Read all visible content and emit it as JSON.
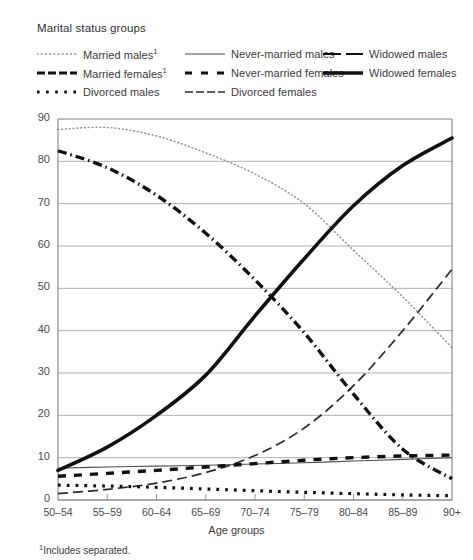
{
  "legend": {
    "title": "Marital status groups",
    "columns": [
      {
        "items": [
          {
            "label": "Married males",
            "footnote_mark": "1",
            "style": "fine-dotted",
            "name": "married-males"
          },
          {
            "label": "Married females",
            "footnote_mark": "1",
            "style": "dash-dot-thick",
            "name": "married-females"
          },
          {
            "label": "Divorced males",
            "footnote_mark": "",
            "style": "square-dotted",
            "name": "divorced-males"
          }
        ]
      },
      {
        "items": [
          {
            "label": "Never-married males",
            "footnote_mark": "",
            "style": "thin-solid",
            "name": "never-married-males"
          },
          {
            "label": "Never-married females",
            "footnote_mark": "",
            "style": "dashed-thick",
            "name": "never-married-females"
          },
          {
            "label": "Divorced females",
            "footnote_mark": "",
            "style": "long-dash-thin",
            "name": "divorced-females"
          }
        ]
      },
      {
        "items": [
          {
            "label": "Widowed males",
            "footnote_mark": "",
            "style": "dash-long-short",
            "name": "widowed-males"
          },
          {
            "label": "Widowed females",
            "footnote_mark": "",
            "style": "heavy-solid",
            "name": "widowed-females"
          }
        ]
      }
    ]
  },
  "footnote": {
    "mark": "1",
    "text": "Includes separated."
  },
  "chart_data": {
    "type": "line",
    "title": "",
    "xlabel": "Age groups",
    "ylabel": "",
    "categories": [
      "50–54",
      "55–59",
      "60–64",
      "65–69",
      "70–74",
      "75–79",
      "80–84",
      "85–89",
      "90+"
    ],
    "yticks": [
      0,
      10,
      20,
      30,
      40,
      50,
      60,
      70,
      80,
      90
    ],
    "ylim": [
      0,
      90
    ],
    "grid": "horizontal",
    "legend_position": "top",
    "series": [
      {
        "name": "Married males",
        "style": "fine-dotted",
        "values": [
          87.5,
          88.0,
          86.0,
          82.0,
          77.0,
          70.0,
          59.0,
          48.0,
          36.0
        ]
      },
      {
        "name": "Married females",
        "style": "dash-dot-thick",
        "values": [
          82.5,
          78.5,
          72.0,
          63.0,
          52.0,
          39.5,
          25.0,
          12.0,
          5.0
        ]
      },
      {
        "name": "Divorced males",
        "style": "square-dotted",
        "values": [
          3.5,
          3.3,
          3.0,
          2.6,
          2.2,
          1.8,
          1.5,
          1.2,
          1.0
        ]
      },
      {
        "name": "Never-married males",
        "style": "thin-solid",
        "values": [
          7.5,
          7.8,
          8.0,
          8.2,
          8.5,
          8.8,
          9.2,
          9.6,
          10.0
        ]
      },
      {
        "name": "Never-married females",
        "style": "dashed-thick",
        "values": [
          5.6,
          6.3,
          7.0,
          7.8,
          8.6,
          9.4,
          10.0,
          10.4,
          10.6
        ]
      },
      {
        "name": "Divorced females",
        "style": "long-dash-thin",
        "values": [
          1.5,
          2.5,
          4.0,
          6.5,
          10.5,
          17.0,
          27.0,
          40.0,
          54.5
        ]
      },
      {
        "name": "Widowed males",
        "style": "dash-long-short",
        "values": [
          0.0,
          0.0,
          0.0,
          0.0,
          0.0,
          0.0,
          0.0,
          0.0,
          0.0
        ]
      },
      {
        "name": "Widowed females",
        "style": "heavy-solid",
        "values": [
          7.0,
          12.5,
          20.0,
          29.5,
          43.5,
          57.0,
          69.5,
          79.0,
          85.5
        ]
      }
    ]
  }
}
